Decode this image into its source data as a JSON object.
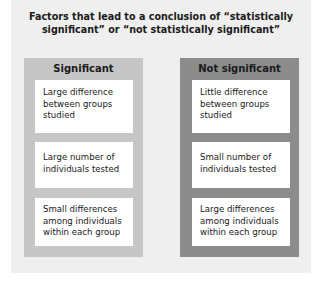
{
  "title": "Factors that lead to a conclusion of “statistically significant” or “not statistically significant”",
  "panels": [
    {
      "heading": "Significant",
      "color": "#c6c6c6",
      "items": [
        "Large difference between groups studied",
        "Large number of individuals tested",
        "Small differences among individuals within each group"
      ]
    },
    {
      "heading": "Not significant",
      "color": "#8c8c8c",
      "items": [
        "Little difference between groups studied",
        "Small number of individuals tested",
        "Large differences among individuals within each group"
      ]
    }
  ]
}
